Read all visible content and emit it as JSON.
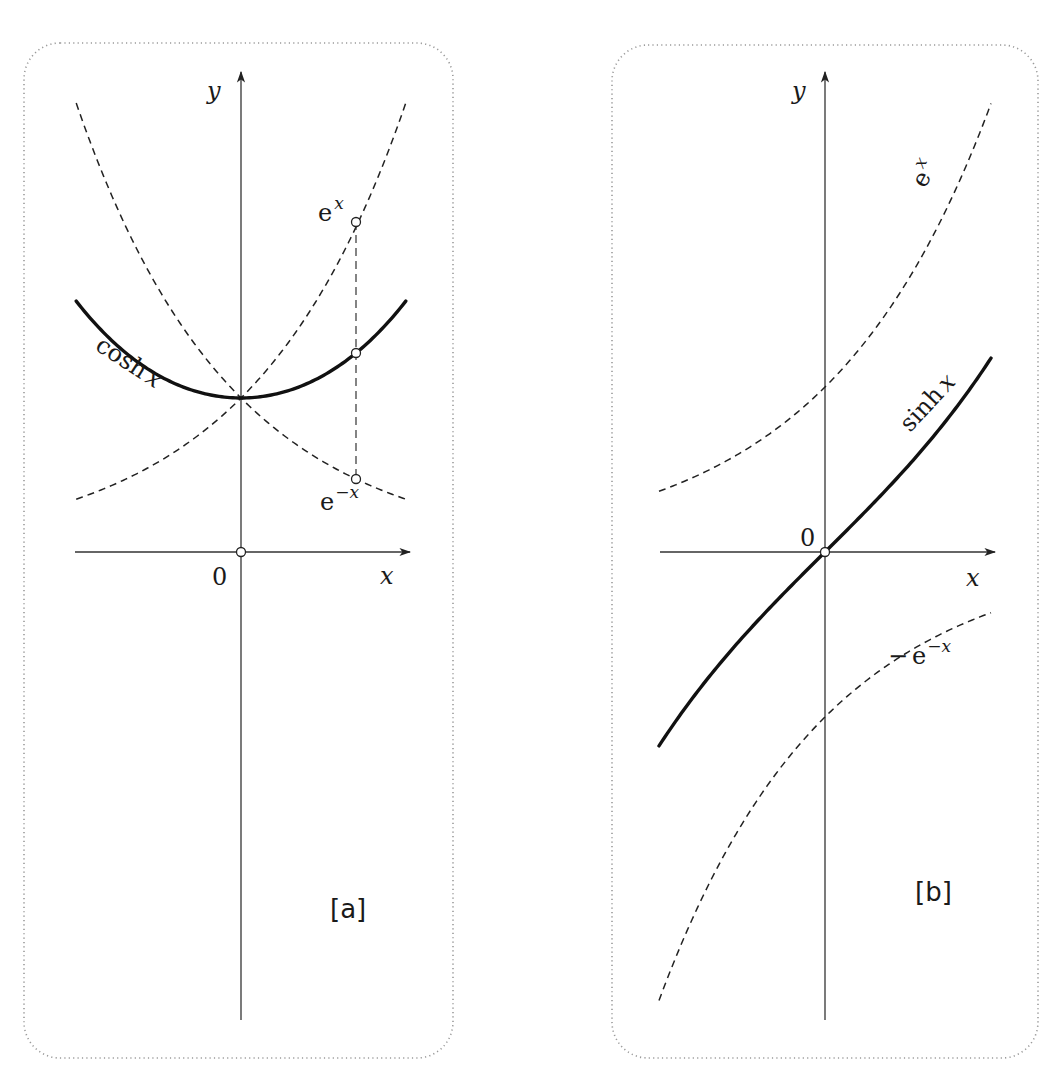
{
  "figure": {
    "panels": [
      {
        "id": "a",
        "tag": "[a]",
        "x_axis_label": "x",
        "y_axis_label": "y",
        "origin_label": "0",
        "solid_curve_label": "cosh x",
        "solid_curve_label_main": "cosh",
        "solid_curve_label_var": "x",
        "dashed_labels": [
          {
            "base": "e",
            "exp": "x"
          },
          {
            "base": "e",
            "exp": "−x"
          }
        ]
      },
      {
        "id": "b",
        "tag": "[b]",
        "x_axis_label": "x",
        "y_axis_label": "y",
        "origin_label": "0",
        "solid_curve_label": "sinh x",
        "solid_curve_label_main": "sinh",
        "solid_curve_label_var": "x",
        "dashed_labels": [
          {
            "base": "e",
            "exp": "x"
          },
          {
            "prefix": "−",
            "base": "e",
            "exp": "−x"
          }
        ]
      }
    ]
  },
  "colors": {
    "curve": "#111111",
    "axis": "#333333",
    "frame": "#9a9a9a",
    "background": "#ffffff"
  },
  "chart_data": [
    {
      "type": "line",
      "title": "[a]",
      "xlabel": "x",
      "ylabel": "y",
      "grid": false,
      "xlim": [
        -1.07,
        1.07
      ],
      "series": [
        {
          "name": "cosh x",
          "style": "solid-thick",
          "function": "cosh(x)",
          "x": [
            -1.07,
            -0.75,
            -0.5,
            0,
            0.5,
            0.75,
            1.07
          ],
          "values": [
            1.63,
            1.29,
            1.13,
            1.0,
            1.13,
            1.29,
            1.63
          ]
        },
        {
          "name": "e^x",
          "style": "dashed",
          "function": "exp(x)",
          "x": [
            -1.07,
            -0.5,
            0,
            0.5,
            0.75,
            1.07
          ],
          "values": [
            0.34,
            0.61,
            1.0,
            1.65,
            2.11,
            2.92
          ]
        },
        {
          "name": "e^-x",
          "style": "dashed",
          "function": "exp(-x)",
          "x": [
            -1.07,
            -0.75,
            -0.5,
            0,
            0.5,
            0.75,
            1.07
          ],
          "values": [
            2.92,
            2.11,
            1.65,
            1.0,
            0.61,
            0.47,
            0.34
          ]
        }
      ],
      "annotations": [
        {
          "type": "marker",
          "x": 0.75,
          "y": 2.11,
          "label": "e^x"
        },
        {
          "type": "marker",
          "x": 0.75,
          "y": 1.29,
          "label": "cosh x"
        },
        {
          "type": "marker",
          "x": 0.75,
          "y": 0.47,
          "label": "e^-x"
        },
        {
          "type": "marker",
          "x": 0,
          "y": 0,
          "label": "0"
        },
        {
          "type": "vertical-dashed-segment",
          "x": 0.75,
          "y_from": 0.47,
          "y_to": 2.11
        }
      ]
    },
    {
      "type": "line",
      "title": "[b]",
      "xlabel": "x",
      "ylabel": "y",
      "grid": false,
      "xlim": [
        -1.0,
        1.0
      ],
      "series": [
        {
          "name": "sinh x",
          "style": "solid-thick",
          "function": "sinh(x)",
          "x": [
            -1.0,
            -0.5,
            0,
            0.5,
            1.0
          ],
          "values": [
            -1.18,
            -0.52,
            0,
            0.52,
            1.18
          ]
        },
        {
          "name": "e^x",
          "style": "dashed",
          "function": "exp(x)",
          "x": [
            -1.0,
            -0.5,
            0,
            0.5,
            1.0
          ],
          "values": [
            0.37,
            0.61,
            1.0,
            1.65,
            2.72
          ]
        },
        {
          "name": "-e^-x",
          "style": "dashed",
          "function": "-exp(-x)",
          "x": [
            -1.0,
            -0.5,
            0,
            0.5,
            1.0
          ],
          "values": [
            -2.72,
            -1.65,
            -1.0,
            -0.61,
            -0.37
          ]
        }
      ],
      "annotations": [
        {
          "type": "marker",
          "x": 0,
          "y": 0,
          "label": "0"
        }
      ]
    }
  ]
}
